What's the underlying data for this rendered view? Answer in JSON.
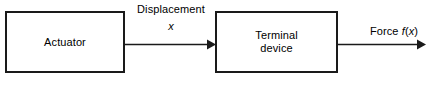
{
  "diagram": {
    "type": "block-diagram",
    "title": "",
    "background_color": "#ffffff",
    "stroke_color": "#1a1a1a",
    "text_color": "#000000",
    "blocks": [
      {
        "id": "actuator",
        "label": "Actuator"
      },
      {
        "id": "terminal-device",
        "label": "Terminal\ndevice"
      }
    ],
    "arrows": [
      {
        "id": "displacement",
        "from": "actuator",
        "to": "terminal-device",
        "label": "Displacement",
        "variable": "x"
      },
      {
        "id": "force",
        "from": "terminal-device",
        "to": "",
        "label_prefix": "Force ",
        "variable": "f",
        "open_paren": "(",
        "argument": "x",
        "close_paren": ")"
      }
    ]
  }
}
